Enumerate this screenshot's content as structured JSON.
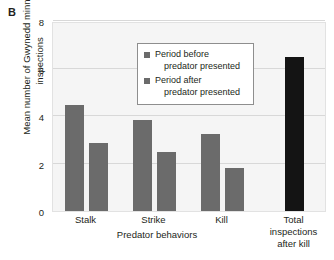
{
  "panel": {
    "label": "B"
  },
  "chart_data": {
    "type": "bar",
    "title": "",
    "subtitle": "",
    "xlabel": "Predator behaviors",
    "ylabel": "Mean number of Gwynedd minnow inspections",
    "ylim": [
      0,
      8
    ],
    "yticks": [
      0,
      2,
      4,
      6,
      8
    ],
    "ytick_labels": [
      "0",
      "2",
      "4",
      "6",
      "8"
    ],
    "grid": true,
    "grid_axis": "y",
    "legend_position": "upper-center-inside",
    "categories": [
      "Stalk",
      "Strike",
      "Kill",
      "Total inspections after kill"
    ],
    "series": [
      {
        "name": "Period before predator presented",
        "color": "#6b6b6b",
        "values": [
          4.45,
          3.85,
          3.25,
          null
        ]
      },
      {
        "name": "Period after predator presented",
        "color": "#6b6b6b",
        "values": [
          2.85,
          2.5,
          1.8,
          null
        ]
      },
      {
        "name": "Total inspections after kill",
        "color": "#141414",
        "values": [
          null,
          null,
          null,
          6.5
        ]
      }
    ],
    "bars": [
      {
        "label": "Stalk before",
        "group": "Stalk",
        "series": "Period before predator presented",
        "value": 4.45,
        "color": "#6b6b6b"
      },
      {
        "label": "Stalk after",
        "group": "Stalk",
        "series": "Period after predator presented",
        "value": 2.85,
        "color": "#6b6b6b"
      },
      {
        "label": "Strike before",
        "group": "Strike",
        "series": "Period before predator presented",
        "value": 3.85,
        "color": "#6b6b6b"
      },
      {
        "label": "Strike after",
        "group": "Strike",
        "series": "Period after predator presented",
        "value": 2.5,
        "color": "#6b6b6b"
      },
      {
        "label": "Kill before",
        "group": "Kill",
        "series": "Period before predator presented",
        "value": 3.25,
        "color": "#6b6b6b"
      },
      {
        "label": "Kill after",
        "group": "Kill",
        "series": "Period after predator presented",
        "value": 1.8,
        "color": "#6b6b6b"
      },
      {
        "label": "Total inspections after kill",
        "group": "Total inspections after kill",
        "series": "Total inspections after kill",
        "value": 6.5,
        "color": "#141414"
      }
    ],
    "xtick_groups": [
      {
        "lines": [
          "Stalk"
        ]
      },
      {
        "lines": [
          "Strike"
        ]
      },
      {
        "lines": [
          "Kill"
        ]
      },
      {
        "lines": [
          "Total",
          "inspections",
          "after kill"
        ]
      }
    ]
  },
  "legend": {
    "entries": [
      {
        "swatch_color": "#6b6b6b",
        "line1": "Period before",
        "line2": "predator presented"
      },
      {
        "swatch_color": "#6b6b6b",
        "line1": "Period after",
        "line2": "predator presented"
      }
    ]
  },
  "colors": {
    "bar_gray": "#6b6b6b",
    "bar_black": "#141414",
    "plot_background": "#f5f5f5",
    "gridline": "#d8d8d8",
    "text": "#231f20"
  }
}
